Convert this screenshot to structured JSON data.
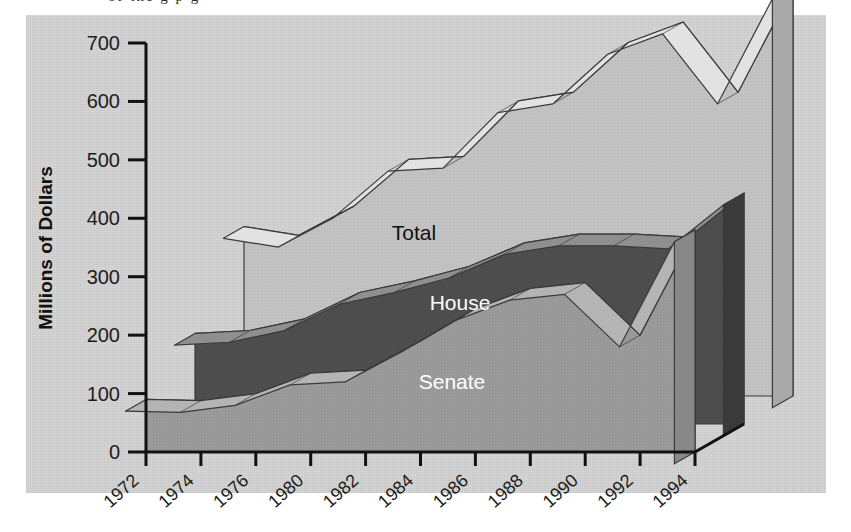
{
  "figure": {
    "background_color": "#ffffff",
    "plate_color": "#d8d8d8",
    "caption_remnant": "of the g  p g"
  },
  "chart_data": {
    "type": "area",
    "title": "",
    "subtitle": "",
    "xlabel": "",
    "ylabel": "Millions of Dollars",
    "ylim": [
      0,
      700
    ],
    "ytick_values": [
      0,
      100,
      200,
      300,
      400,
      500,
      600,
      700
    ],
    "ytick_labels": [
      "0",
      "100",
      "200",
      "300",
      "400",
      "500",
      "600",
      "700"
    ],
    "grid": false,
    "legend_position": "inline-annotations",
    "projection": "3d-ribbon",
    "x": [
      1972,
      1974,
      1976,
      1980,
      1982,
      1984,
      1986,
      1988,
      1990,
      1992,
      1994
    ],
    "xtick_labels": [
      "1972",
      "1974",
      "1976",
      "1980",
      "1982",
      "1984",
      "1986",
      "1988",
      "1990",
      "1992",
      "1994"
    ],
    "series": [
      {
        "name": "Senate",
        "color": "#9a9a9a",
        "label_color": "#ffffff",
        "values": [
          90,
          88,
          100,
          135,
          140,
          190,
          245,
          280,
          290,
          200,
          380
        ]
      },
      {
        "name": "House",
        "color": "#4e4e4e",
        "label_color": "#ffffff",
        "values": [
          155,
          160,
          180,
          225,
          245,
          270,
          310,
          325,
          325,
          320,
          395
        ]
      },
      {
        "name": "Total",
        "color": "#c2c2c2",
        "label_color": "#111111",
        "values": [
          290,
          275,
          325,
          405,
          410,
          505,
          520,
          605,
          640,
          520,
          700
        ]
      }
    ],
    "annotations": [
      {
        "text": "Total",
        "series": "Total",
        "x": 1982
      },
      {
        "text": "House",
        "series": "House",
        "x": 1984
      },
      {
        "text": "Senate",
        "series": "Senate",
        "x": 1984
      }
    ]
  },
  "axis": {
    "y_axis_label": "Millions of Dollars",
    "y_ticks": [
      "700",
      "600",
      "500",
      "400",
      "300",
      "200",
      "100",
      "0"
    ],
    "x_ticks": [
      "1972",
      "1974",
      "1976",
      "1980",
      "1982",
      "1984",
      "1986",
      "1988",
      "1990",
      "1992",
      "1994"
    ]
  },
  "labels": {
    "total": "Total",
    "house": "House",
    "senate": "Senate"
  },
  "colors": {
    "plate": "#d8d8d8",
    "total_top": "#c2c2c2",
    "total_side": "#cccccc",
    "house_top": "#4e4e4e",
    "house_side": "#8f8f8f",
    "senate_top": "#9a9a9a",
    "senate_side": "#a6a6a6",
    "axis": "#111111",
    "outline": "#3a3a3a"
  }
}
